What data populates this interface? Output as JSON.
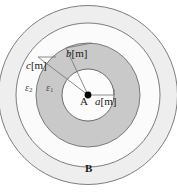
{
  "figure": {
    "type": "coaxial-cable-cross-section",
    "center_label": "A",
    "outer_conductor_label": "B",
    "radii": [
      {
        "key": "a",
        "symbol": "a",
        "unit": "[m]",
        "label": "a[m]",
        "pixel_radius": 26
      },
      {
        "key": "b",
        "symbol": "b",
        "unit": "[m]",
        "label": "b[m]",
        "pixel_radius": 52
      },
      {
        "key": "c",
        "symbol": "c",
        "unit": "[m]",
        "label": "c[m]",
        "pixel_radius": 72
      }
    ],
    "dielectrics": [
      {
        "key": "eps1",
        "symbol": "ε",
        "subscript": "1",
        "label": "ε₁",
        "region": "between a and b"
      },
      {
        "key": "eps2",
        "symbol": "ε",
        "subscript": "2",
        "label": "ε₂",
        "region": "between b and c"
      }
    ],
    "geometry": {
      "center_x": 88,
      "center_y": 95,
      "r_inner_conductor": 26,
      "r_dielectric1_outer": 52,
      "r_dielectric2_outer": 72,
      "r_outer_conductor": 90
    },
    "colors": {
      "background": "#ffffff",
      "inner_conductor_fill": "#fcfcfc",
      "dielectric1_fill": "#c9c9c9",
      "dielectric2_fill": "#fbfbfb",
      "outer_conductor_fill": "#eeeeee",
      "stroke": "#6b6b6b",
      "center_dot": "#000000",
      "leader_line": "#777777",
      "text": "#1a1a1a"
    }
  }
}
